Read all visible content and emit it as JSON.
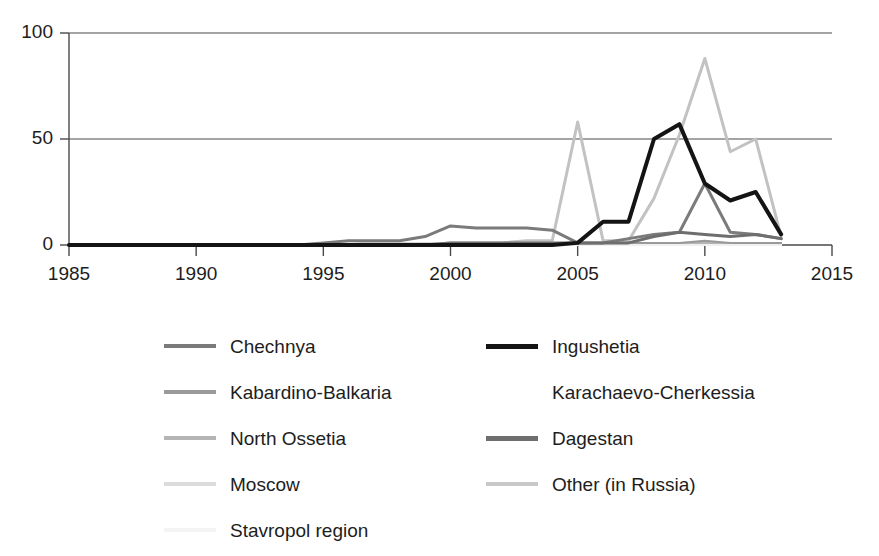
{
  "chart_data": {
    "type": "line",
    "title": "",
    "subtitle": "",
    "xlabel": "",
    "ylabel": "",
    "xlim": [
      1985,
      2015
    ],
    "ylim": [
      0,
      100
    ],
    "xticks": [
      1985,
      1990,
      1995,
      2000,
      2005,
      2010,
      2015
    ],
    "yticks": [
      0,
      50,
      100
    ],
    "grid": "horizontal",
    "legend_position": "below",
    "x": [
      1985,
      1986,
      1987,
      1988,
      1989,
      1990,
      1991,
      1992,
      1993,
      1994,
      1995,
      1996,
      1997,
      1998,
      1999,
      2000,
      2001,
      2002,
      2003,
      2004,
      2005,
      2006,
      2007,
      2008,
      2009,
      2010,
      2011,
      2012,
      2013
    ],
    "series": [
      {
        "name": "Chechnya",
        "color": "#7b7b7b",
        "width": 3,
        "values": [
          0,
          0,
          0,
          0,
          0,
          0,
          0,
          0,
          0,
          0,
          1,
          2,
          2,
          2,
          4,
          9,
          8,
          8,
          8,
          7,
          1,
          1,
          3,
          5,
          6,
          29,
          6,
          5,
          3
        ]
      },
      {
        "name": "Ingushetia",
        "color": "#141414",
        "width": 4,
        "values": [
          0,
          0,
          0,
          0,
          0,
          0,
          0,
          0,
          0,
          0,
          0,
          0,
          0,
          0,
          0,
          0,
          0,
          0,
          0,
          0,
          1,
          11,
          11,
          50,
          57,
          29,
          21,
          25,
          5
        ]
      },
      {
        "name": "Kabardino-Balkaria",
        "color": "#9a9a9a",
        "width": 2,
        "values": [
          0,
          0,
          0,
          0,
          0,
          0,
          0,
          0,
          0,
          0,
          0,
          0,
          0,
          0,
          0,
          1,
          1,
          1,
          1,
          1,
          1,
          1,
          1,
          1,
          1,
          2,
          1,
          1,
          1
        ]
      },
      {
        "name": "Karachaevo-Cherkessia",
        "color": "#ffffff",
        "width": 2,
        "values": [
          0,
          0,
          0,
          0,
          0,
          0,
          0,
          0,
          0,
          0,
          0,
          0,
          0,
          0,
          0,
          0,
          0,
          0,
          0,
          0,
          0,
          0,
          0,
          0,
          0,
          0,
          0,
          0,
          0
        ]
      },
      {
        "name": "North Ossetia",
        "color": "#b5b5b5",
        "width": 2,
        "values": [
          0,
          0,
          0,
          0,
          0,
          0,
          0,
          0,
          0,
          0,
          0,
          0,
          0,
          0,
          0,
          1,
          1,
          1,
          1,
          1,
          1,
          1,
          1,
          1,
          1,
          1,
          1,
          1,
          1
        ]
      },
      {
        "name": "Dagestan",
        "color": "#6e6e6e",
        "width": 3,
        "values": [
          0,
          0,
          0,
          0,
          0,
          0,
          0,
          0,
          0,
          0,
          0,
          0,
          0,
          0,
          0,
          1,
          1,
          1,
          1,
          1,
          1,
          1,
          1,
          4,
          6,
          5,
          4,
          5,
          3
        ]
      },
      {
        "name": "Moscow",
        "color": "#d8d8d8",
        "width": 2,
        "values": [
          0,
          0,
          0,
          0,
          0,
          0,
          0,
          0,
          0,
          0,
          1,
          2,
          1,
          1,
          1,
          1,
          1,
          1,
          1,
          1,
          1,
          1,
          1,
          1,
          1,
          1,
          1,
          1,
          1
        ]
      },
      {
        "name": "Other (in Russia)",
        "color": "#c2c2c2",
        "width": 3,
        "values": [
          0,
          0,
          0,
          0,
          0,
          0,
          0,
          0,
          0,
          0,
          0,
          0,
          0,
          0,
          0,
          1,
          1,
          1,
          2,
          2,
          58,
          2,
          2,
          22,
          52,
          88,
          44,
          50,
          4
        ]
      },
      {
        "name": "Stavropol region",
        "color": "#f0f0f0",
        "width": 2,
        "values": [
          0,
          0,
          0,
          0,
          0,
          0,
          0,
          0,
          0,
          0,
          0,
          0,
          0,
          0,
          0,
          0,
          0,
          0,
          0,
          0,
          0,
          0,
          0,
          0,
          0,
          0,
          0,
          0,
          0
        ]
      }
    ]
  },
  "axis": {
    "yticks": [
      "0",
      "50",
      "100"
    ],
    "xticks": [
      "1985",
      "1990",
      "1995",
      "2000",
      "2005",
      "2010",
      "2015"
    ]
  },
  "legend": {
    "left_column": [
      {
        "label": "Chechnya",
        "color": "#7b7b7b",
        "thick": false
      },
      {
        "label": "Kabardino-Balkaria",
        "color": "#9a9a9a",
        "thick": false
      },
      {
        "label": "North Ossetia",
        "color": "#b5b5b5",
        "thick": false
      },
      {
        "label": "Moscow",
        "color": "#dcdcdc",
        "thick": false
      },
      {
        "label": "Stavropol region",
        "color": "#f4f4f4",
        "thick": false
      }
    ],
    "right_column": [
      {
        "label": "Ingushetia",
        "color": "#141414",
        "thick": true
      },
      {
        "label": "Karachaevo-Cherkessia",
        "color": "#ffffff",
        "thick": false
      },
      {
        "label": "Dagestan",
        "color": "#6e6e6e",
        "thick": true
      },
      {
        "label": "Other (in Russia)",
        "color": "#c8c8c8",
        "thick": false
      }
    ]
  }
}
